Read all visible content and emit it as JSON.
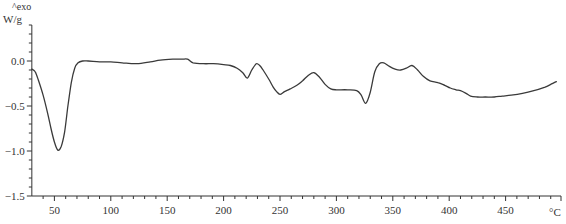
{
  "chart_data": {
    "type": "line",
    "title": "",
    "xlabel": "°C",
    "ylabel": "W/g",
    "annotation": "^exo",
    "xlim": [
      30,
      495
    ],
    "ylim": [
      -1.5,
      0.4
    ],
    "x_ticks": [
      50,
      100,
      150,
      200,
      250,
      300,
      350,
      400,
      450
    ],
    "x_tick_labels": [
      "50",
      "100",
      "150",
      "200",
      "250",
      "300",
      "350",
      "400",
      "450"
    ],
    "y_ticks": [
      0.0,
      -0.5,
      -1.0,
      -1.5
    ],
    "y_tick_labels": [
      "0.0",
      "-0.5",
      "-1.0",
      "-1.5"
    ],
    "x_minor_step": 10,
    "y_minor_step": 0.1,
    "grid": false,
    "legend": null,
    "line_color": "#3a3a3a",
    "series": [
      {
        "name": "DSC heat flow",
        "x": [
          30,
          33,
          36,
          40,
          44,
          47,
          50,
          53,
          56,
          59,
          62,
          65,
          68,
          71,
          75,
          80,
          90,
          100,
          110,
          123,
          135,
          144,
          155,
          163,
          168,
          173,
          182,
          191,
          200,
          206,
          212,
          217,
          221,
          225,
          229,
          232,
          235,
          240,
          244,
          247,
          250,
          254,
          259,
          265,
          270,
          275,
          280,
          285,
          290,
          295,
          300,
          310,
          318,
          322,
          326,
          330,
          334,
          338,
          342,
          347,
          352,
          357,
          362,
          367,
          372,
          377,
          383,
          390,
          396,
          401,
          406,
          410,
          415,
          419,
          425,
          432,
          440,
          447,
          455,
          465,
          475,
          485,
          490,
          495
        ],
        "y": [
          -0.09,
          -0.12,
          -0.22,
          -0.38,
          -0.58,
          -0.75,
          -0.9,
          -0.99,
          -0.95,
          -0.79,
          -0.5,
          -0.24,
          -0.08,
          -0.02,
          0.0,
          0.0,
          -0.01,
          -0.01,
          -0.02,
          -0.03,
          -0.01,
          0.01,
          0.02,
          0.02,
          0.02,
          -0.02,
          -0.03,
          -0.03,
          -0.04,
          -0.05,
          -0.08,
          -0.13,
          -0.19,
          -0.1,
          -0.03,
          -0.05,
          -0.1,
          -0.2,
          -0.29,
          -0.34,
          -0.37,
          -0.34,
          -0.31,
          -0.27,
          -0.22,
          -0.16,
          -0.13,
          -0.18,
          -0.26,
          -0.31,
          -0.32,
          -0.32,
          -0.33,
          -0.38,
          -0.47,
          -0.35,
          -0.12,
          -0.03,
          -0.02,
          -0.06,
          -0.09,
          -0.1,
          -0.08,
          -0.05,
          -0.1,
          -0.17,
          -0.22,
          -0.24,
          -0.27,
          -0.3,
          -0.32,
          -0.33,
          -0.36,
          -0.39,
          -0.4,
          -0.4,
          -0.4,
          -0.39,
          -0.38,
          -0.36,
          -0.33,
          -0.29,
          -0.26,
          -0.23
        ]
      }
    ]
  },
  "axes": {
    "exo_label": "^exo",
    "y_unit": "W/g",
    "x_unit": "°C"
  }
}
